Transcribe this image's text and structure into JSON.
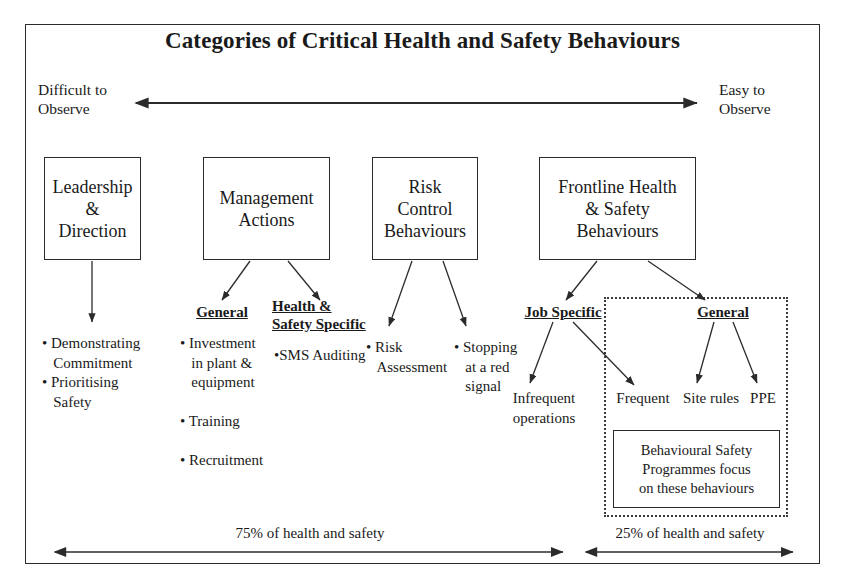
{
  "title": "Categories of Critical Health and Safety Behaviours",
  "axis": {
    "left_label": "Difficult to\nObserve",
    "left_label_line1": "Difficult to",
    "left_label_line2": "Observe",
    "right_label_line1": "Easy to",
    "right_label_line2": "Observe"
  },
  "categories": [
    {
      "id": "leadership",
      "title": "Leadership\n&\nDirection",
      "line1": "Leadership",
      "line2": "&",
      "line3": "Direction"
    },
    {
      "id": "management",
      "title": "Management\nActions",
      "line1": "Management",
      "line2": "Actions"
    },
    {
      "id": "risk-control",
      "title": "Risk\nControl\nBehaviours",
      "line1": "Risk",
      "line2": "Control",
      "line3": "Behaviours"
    },
    {
      "id": "frontline",
      "title": "Frontline Health\n& Safety\nBehaviours",
      "line1": "Frontline Health",
      "line2": "& Safety",
      "line3": "Behaviours"
    }
  ],
  "leadership_bullets": {
    "line1": "• Demonstrating",
    "line2": "   Commitment",
    "line3": "• Prioritising",
    "line4": "   Safety"
  },
  "management": {
    "general_heading": "General",
    "general_bullets": {
      "line1": "• Investment",
      "line2": "   in plant &",
      "line3": "   equipment",
      "line4": "",
      "line5": "• Training",
      "line6": "",
      "line7": "• Recruitment"
    },
    "hs_heading_line1": "Health &",
    "hs_heading_line2": "Safety Specific",
    "hs_bullet": "•SMS Auditing"
  },
  "risk_control": {
    "bullet1_line1": "• Risk",
    "bullet1_line2": "   Assessment",
    "bullet2_line1": "• Stopping",
    "bullet2_line2": "   at a red",
    "bullet2_line3": "   signal"
  },
  "frontline": {
    "job_specific_heading": "Job Specific",
    "general_heading": "General",
    "infrequent_line1": "Infrequent",
    "infrequent_line2": "operations",
    "frequent": "Frequent",
    "site_rules": "Site rules",
    "ppe": "PPE",
    "focus_note_line1": "Behavioural Safety",
    "focus_note_line2": "Programmes focus",
    "focus_note_line3": "on these behaviours"
  },
  "footer": {
    "left_pct": "75% of health and safety",
    "right_pct": "25% of health and safety"
  },
  "colors": {
    "ink": "#1a1a1a",
    "line": "#2b2b2b",
    "background": "#ffffff"
  }
}
